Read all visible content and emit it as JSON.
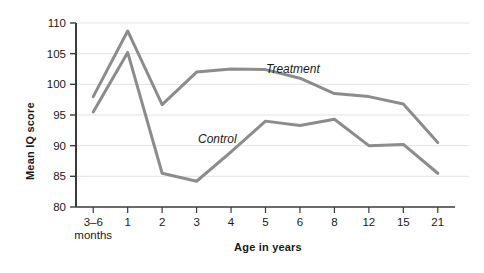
{
  "chart_data": {
    "type": "line",
    "title": "",
    "xlabel": "Age in years",
    "ylabel": "Mean IQ score",
    "categories": [
      "3–6\nmonths",
      "1",
      "2",
      "3",
      "4",
      "5",
      "6",
      "8",
      "12",
      "15",
      "21"
    ],
    "category_labels": [
      {
        "line1": "3–6",
        "line2": "months"
      },
      {
        "line1": "1",
        "line2": ""
      },
      {
        "line1": "2",
        "line2": ""
      },
      {
        "line1": "3",
        "line2": ""
      },
      {
        "line1": "4",
        "line2": ""
      },
      {
        "line1": "5",
        "line2": ""
      },
      {
        "line1": "6",
        "line2": ""
      },
      {
        "line1": "8",
        "line2": ""
      },
      {
        "line1": "12",
        "line2": ""
      },
      {
        "line1": "15",
        "line2": ""
      },
      {
        "line1": "21",
        "line2": ""
      }
    ],
    "ylim": [
      80,
      110
    ],
    "yticks": [
      80,
      85,
      90,
      95,
      100,
      105,
      110
    ],
    "ytick_labels": [
      "80",
      "85",
      "90",
      "95",
      "100",
      "105",
      "110"
    ],
    "grid": true,
    "grid_axis": "y",
    "legend": "inline-annotations",
    "series": [
      {
        "name": "Treatment",
        "color": "#8c8c8c",
        "values": [
          98.0,
          108.7,
          96.7,
          102.0,
          102.5,
          102.4,
          101.0,
          98.5,
          98.0,
          96.8,
          90.5
        ],
        "annotation": {
          "text": "Treatment",
          "at_category": "4"
        }
      },
      {
        "name": "Control",
        "color": "#8c8c8c",
        "values": [
          95.5,
          105.2,
          85.5,
          84.2,
          89.0,
          94.0,
          93.3,
          94.3,
          90.0,
          90.2,
          85.5
        ],
        "annotation": {
          "text": "Control",
          "at_category": "3"
        }
      }
    ],
    "annotations": [
      {
        "name": "treatment-label",
        "text": "Treatment"
      },
      {
        "name": "control-label",
        "text": "Control"
      }
    ],
    "colors": {
      "line": "#8c8c8c",
      "axis": "#3a3a3a",
      "grid": "#e2e2e2",
      "background": "#ffffff",
      "text": "#1a1a1a"
    }
  }
}
